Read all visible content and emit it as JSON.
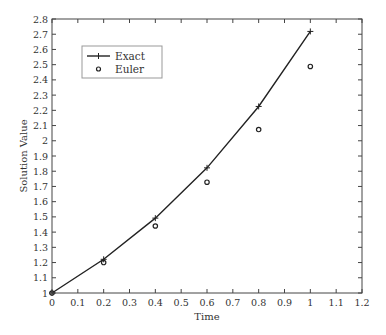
{
  "chart_data": {
    "type": "line",
    "title": "",
    "xlabel": "Time",
    "ylabel": "Solution Value",
    "xlim": [
      0,
      1.2
    ],
    "ylim": [
      1,
      2.8
    ],
    "xticks": [
      "0",
      "0.1",
      "0.2",
      "0.3",
      "0.4",
      "0.5",
      "0.6",
      "0.7",
      "0.8",
      "0.9",
      "1",
      "1.1",
      "1.2"
    ],
    "yticks": [
      "1",
      "1.1",
      "1.2",
      "1.3",
      "1.4",
      "1.5",
      "1.6",
      "1.7",
      "1.8",
      "1.9",
      "2",
      "2.1",
      "2.2",
      "2.3",
      "2.4",
      "2.5",
      "2.6",
      "2.7",
      "2.8"
    ],
    "grid": false,
    "legend_position": "upper left",
    "series": [
      {
        "name": "Exact",
        "style": "line with + markers",
        "x": [
          0,
          0.2,
          0.4,
          0.6,
          0.8,
          1.0
        ],
        "values": [
          1.0,
          1.2214,
          1.4918,
          1.8221,
          2.2255,
          2.7183
        ]
      },
      {
        "name": "Euler",
        "style": "circle markers",
        "x": [
          0,
          0.2,
          0.4,
          0.6,
          0.8,
          1.0
        ],
        "values": [
          1.0,
          1.2,
          1.44,
          1.728,
          2.0736,
          2.4883
        ]
      }
    ]
  },
  "legend": {
    "exact_label": "Exact",
    "euler_label": "Euler"
  },
  "axes": {
    "xlabel": "Time",
    "ylabel": "Solution Value"
  }
}
